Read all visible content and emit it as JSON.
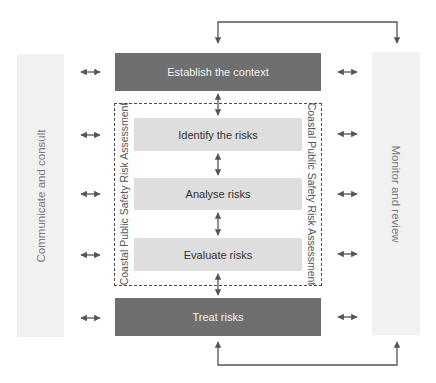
{
  "diagram": {
    "side_panels": {
      "left": {
        "label": "Communicate and consult"
      },
      "right": {
        "label": "Monitor and review"
      }
    },
    "steps": [
      {
        "id": "establish",
        "label": "Establish the context",
        "style": "dark"
      },
      {
        "id": "identify",
        "label": "Identify the risks",
        "style": "light"
      },
      {
        "id": "analyse",
        "label": "Analyse risks",
        "style": "light"
      },
      {
        "id": "evaluate",
        "label": "Evaluate risks",
        "style": "light"
      },
      {
        "id": "treat",
        "label": "Treat risks",
        "style": "dark"
      }
    ],
    "assessment_group": {
      "label_left": "Coastal Public Safety Risk Assessment",
      "label_right": "Coastal Public Safety Risk Assessment"
    },
    "connectors": {
      "feedback_top": "Establish the context ↔ Monitor and review (top loop)",
      "feedback_bottom": "Treat risks ↔ Monitor and review (bottom loop)",
      "side_links_count": 10,
      "vertical_links_count": 4
    },
    "colors": {
      "dark_box": "#6f6f6f",
      "light_box": "#dedede",
      "side_panel": "#f1f1f1",
      "arrow": "#555555"
    }
  }
}
